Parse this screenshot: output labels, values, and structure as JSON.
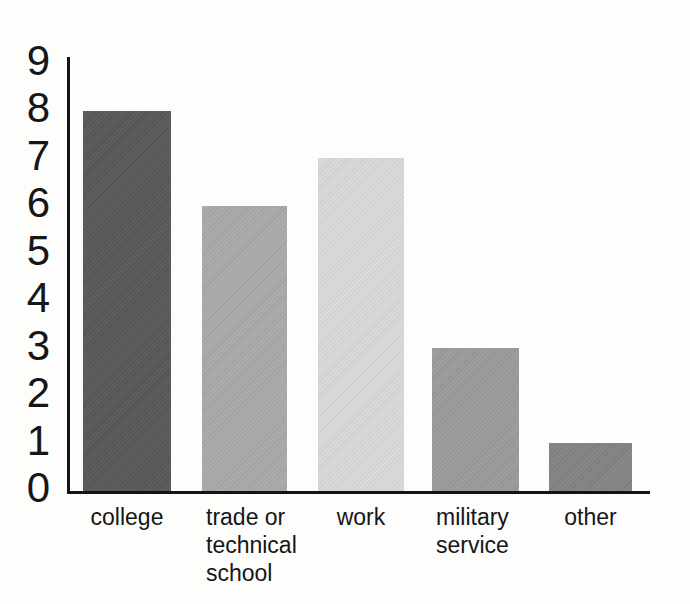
{
  "chart_data": {
    "type": "bar",
    "categories": [
      "college",
      "trade or technical school",
      "work",
      "military service",
      "other"
    ],
    "category_lines": [
      [
        "college"
      ],
      [
        "trade or",
        "technical",
        "school"
      ],
      [
        "work"
      ],
      [
        "military",
        "service"
      ],
      [
        "other"
      ]
    ],
    "values": [
      8,
      6,
      7,
      3,
      1
    ],
    "bar_colors": [
      "#575757",
      "#a8a8a8",
      "#d8d8d8",
      "#9a9a9a",
      "#828282"
    ],
    "yticks": [
      0,
      1,
      2,
      3,
      4,
      5,
      6,
      7,
      8,
      9
    ],
    "ylim": [
      0,
      9
    ],
    "xlabel": "",
    "ylabel": "",
    "title": "",
    "grid": false,
    "legend_position": "none",
    "axis_color": "#141414"
  }
}
